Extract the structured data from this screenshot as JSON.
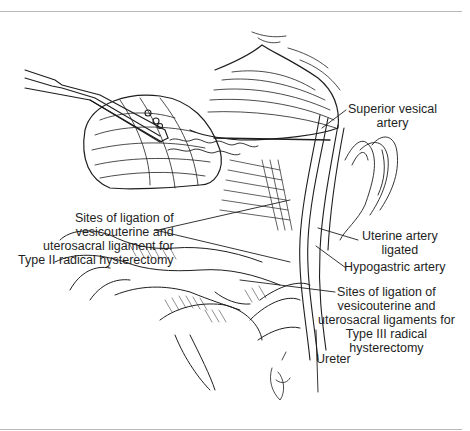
{
  "figure": {
    "labels": {
      "superior_vesical_artery": "Superior vesical\nartery",
      "type_ii_sites": "Sites of ligation of\nvesicouterine and\nuterosacral ligament for\nType II radical hysterectomy",
      "uterine_artery": "Uterine artery\nligated",
      "hypogastric_artery": "Hypogastric artery",
      "type_iii_sites": "Sites of ligation of\nvesicouterine and\nuterosacral ligaments for\nType III radical\nhysterectomy",
      "ureter": "Ureter"
    },
    "colors": {
      "ink": "#1e1e1e",
      "rule": "#b9b9b9",
      "background": "#ffffff"
    }
  }
}
